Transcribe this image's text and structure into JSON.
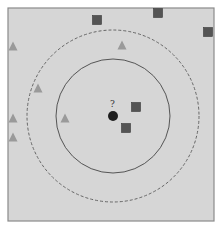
{
  "diagram": {
    "colors": {
      "background": "#ffffff",
      "panel_fill": "#d6d6d6",
      "panel_border": "#8a8a8a",
      "square": "#545454",
      "square_border": "#3a3a3a",
      "triangle": "#9a9a9a",
      "query_point": "#1e1e1e",
      "inner_circle": "#555555",
      "outer_circle": "#666666"
    },
    "panel": {
      "x": 8,
      "y": 8,
      "width": 206,
      "height": 213
    },
    "query": {
      "label": "?",
      "cx": 113,
      "cy": 116,
      "r": 5
    },
    "circles": [
      {
        "name": "inner-circle",
        "style": "solid",
        "cx": 113,
        "cy": 116,
        "r": 57
      },
      {
        "name": "outer-circle",
        "style": "dashed",
        "cx": 113,
        "cy": 116,
        "r": 86
      }
    ],
    "squares": [
      {
        "cx": 97,
        "cy": 20
      },
      {
        "cx": 158,
        "cy": 13
      },
      {
        "cx": 208,
        "cy": 32
      },
      {
        "cx": 136,
        "cy": 107
      },
      {
        "cx": 126,
        "cy": 128
      }
    ],
    "triangles": [
      {
        "cx": 13,
        "cy": 46
      },
      {
        "cx": 122,
        "cy": 45
      },
      {
        "cx": 38,
        "cy": 88
      },
      {
        "cx": 13,
        "cy": 118
      },
      {
        "cx": 65,
        "cy": 118
      },
      {
        "cx": 13,
        "cy": 137
      }
    ],
    "marker_size": 9
  }
}
